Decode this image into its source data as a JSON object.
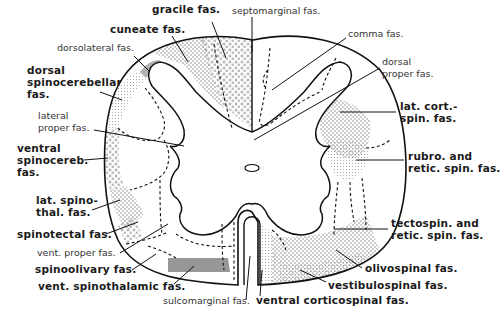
{
  "diagram": {
    "colors": {
      "line": "#111111",
      "stipple": "#9a9a9a",
      "background": "#ffffff"
    },
    "labels": [
      {
        "id": "gracile",
        "text": "gracile fas.",
        "style": "bold",
        "x": 152,
        "y": 6
      },
      {
        "id": "septomarginal",
        "text": "septomarginal fas.",
        "style": "thin",
        "x": 232,
        "y": 8
      },
      {
        "id": "cuneate",
        "text": "cuneate fas.",
        "style": "bold",
        "x": 110,
        "y": 26
      },
      {
        "id": "comma",
        "text": "comma fas.",
        "style": "thin",
        "x": 348,
        "y": 31
      },
      {
        "id": "dorsolateral",
        "text": "dorsolateral fas.",
        "style": "thin",
        "x": 57,
        "y": 44
      },
      {
        "id": "dorsal-spinocereb",
        "text": "dorsal\nspinocerebellar\nfas.",
        "style": "bold",
        "x": 27,
        "y": 65
      },
      {
        "id": "dorsal-proper",
        "text": "dorsal\nproper fas.",
        "style": "thin",
        "x": 382,
        "y": 55
      },
      {
        "id": "lateral-proper",
        "text": "lateral\nproper fas.",
        "style": "thin",
        "x": 38,
        "y": 110
      },
      {
        "id": "lat-cort-spin",
        "text": "lat. cort.-\nspin. fas.",
        "style": "bold",
        "x": 400,
        "y": 100
      },
      {
        "id": "ventral-spinocereb",
        "text": "ventral\nspinocereb.\nfas.",
        "style": "bold",
        "x": 17,
        "y": 141
      },
      {
        "id": "rubro-retic",
        "text": "rubro. and\nretic. spin. fas.",
        "style": "bold",
        "x": 408,
        "y": 149
      },
      {
        "id": "lat-spinothal",
        "text": "lat. spino-\nthal. fas.",
        "style": "bold",
        "x": 36,
        "y": 195
      },
      {
        "id": "spinotectal",
        "text": "spinotectal fas.",
        "style": "bold",
        "x": 17,
        "y": 228
      },
      {
        "id": "tectospin-retic",
        "text": "tectospin. and\nretic. spin. fas.",
        "style": "bold",
        "x": 391,
        "y": 217
      },
      {
        "id": "vent-proper",
        "text": "vent. proper fas.",
        "style": "thin",
        "x": 37,
        "y": 247
      },
      {
        "id": "spinoolivary",
        "text": "spinoolivary fas.",
        "style": "bold",
        "x": 35,
        "y": 264
      },
      {
        "id": "olivospinal",
        "text": "olivospinal fas.",
        "style": "bold",
        "x": 365,
        "y": 263
      },
      {
        "id": "vent-spinothalamic",
        "text": "vent. spinothalamic fas.",
        "style": "bold",
        "x": 38,
        "y": 281
      },
      {
        "id": "vestibulospinal",
        "text": "vestibulospinal fas.",
        "style": "bold",
        "x": 328,
        "y": 280
      },
      {
        "id": "sulcomarginal",
        "text": "sulcomarginal fas.",
        "style": "thin",
        "x": 163,
        "y": 296
      },
      {
        "id": "ventral-corticospinal",
        "text": "ventral corticospinal fas.",
        "style": "bold",
        "x": 256,
        "y": 296
      }
    ]
  }
}
